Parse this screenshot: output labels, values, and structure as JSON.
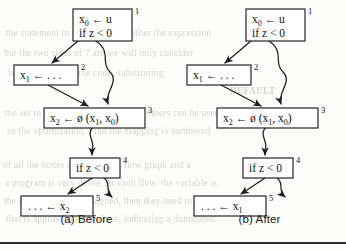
{
  "figure": {
    "panels": [
      {
        "id": "before",
        "caption": "(a) Before",
        "nodes": [
          {
            "id": "n1",
            "label": "1",
            "lines": [
              "x0 ← u",
              "if z < 0"
            ]
          },
          {
            "id": "n2",
            "label": "2",
            "lines": [
              "x1 ← . . ."
            ]
          },
          {
            "id": "n3",
            "label": "3",
            "lines": [
              "x2 ← ø (x1, x0)"
            ]
          },
          {
            "id": "n4",
            "label": "4",
            "lines": [
              "if z < 0"
            ]
          },
          {
            "id": "n5",
            "label": "5",
            "lines": [
              ". . . ← x2"
            ]
          }
        ],
        "edges": [
          {
            "from": "n1",
            "to": "n2",
            "style": "straight"
          },
          {
            "from": "n1",
            "to": "n3",
            "style": "wavy"
          },
          {
            "from": "n2",
            "to": "n3",
            "style": "straight"
          },
          {
            "from": "n3",
            "to": "n4",
            "style": "wavy"
          },
          {
            "from": "n4",
            "to": "n5",
            "style": "straight"
          },
          {
            "from": "n4",
            "to": "exit",
            "style": "wavy"
          }
        ]
      },
      {
        "id": "after",
        "caption": "(b) After",
        "nodes": [
          {
            "id": "n1",
            "label": "1",
            "lines": [
              "x0 ← u",
              "if z < 0"
            ]
          },
          {
            "id": "n2",
            "label": "2",
            "lines": [
              "x1 ← . . ."
            ]
          },
          {
            "id": "n3",
            "label": "3",
            "lines": [
              "x2 ← ø (x1, x0)"
            ]
          },
          {
            "id": "n4",
            "label": "4",
            "lines": [
              "if z < 0"
            ]
          },
          {
            "id": "n5",
            "label": "5",
            "lines": [
              ". . . ← x1"
            ]
          }
        ],
        "edges": [
          {
            "from": "n1",
            "to": "n2",
            "style": "straight"
          },
          {
            "from": "n1",
            "to": "n3",
            "style": "wavy"
          },
          {
            "from": "n2",
            "to": "n3",
            "style": "straight"
          },
          {
            "from": "n3",
            "to": "n4",
            "style": "wavy"
          },
          {
            "from": "n4",
            "to": "n5",
            "style": "straight"
          },
          {
            "from": "n4",
            "to": "exit",
            "style": "wavy"
          }
        ]
      }
    ]
  },
  "text": {
    "node_a_1_l1_base": "x",
    "node_a_1_l1_sub": "0",
    "node_a_1_l1_rest": " ← u",
    "node_a_1_l2": "if z < 0",
    "node_a_1_tag": "1",
    "node_a_2_base": "x",
    "node_a_2_sub": "1",
    "node_a_2_rest": " ← . . .",
    "node_a_2_tag": "2",
    "node_a_3_base": "x",
    "node_a_3_sub": "2",
    "node_a_3_mid": " ← ø (x",
    "node_a_3_sub2": "1",
    "node_a_3_mid2": ", x",
    "node_a_3_sub3": "0",
    "node_a_3_end": ")",
    "node_a_3_tag": "3",
    "node_a_4": "if z < 0",
    "node_a_4_tag": "4",
    "node_a_5_pre": ". . . ← x",
    "node_a_5_sub": "2",
    "node_a_5_tag": "5",
    "node_b_1_l1_base": "x",
    "node_b_1_l1_sub": "0",
    "node_b_1_l1_rest": " ← u",
    "node_b_1_l2": "if z < 0",
    "node_b_1_tag": "1",
    "node_b_2_base": "x",
    "node_b_2_sub": "1",
    "node_b_2_rest": " ← . . .",
    "node_b_2_tag": "2",
    "node_b_3_base": "x",
    "node_b_3_sub": "2",
    "node_b_3_mid": " ← ø (x",
    "node_b_3_sub2": "1",
    "node_b_3_mid2": ", x",
    "node_b_3_sub3": "0",
    "node_b_3_end": ")",
    "node_b_3_tag": "3",
    "node_b_4": "if z < 0",
    "node_b_4_tag": "4",
    "node_b_5_pre": ". . . ← x",
    "node_b_5_sub": "1",
    "node_b_5_tag": "5",
    "caption_a": "(a) Before",
    "caption_b": "(b) After"
  },
  "bleed_through": {
    "lines": [
      "the statement in question or whether the expression",
      "but the two sides of 7 are we will only consider",
      "is represented by the code, substituting",
      "DEFAULT",
      "the set to variable and a number of others can be used",
      "so the optimization. Find the mapping is numbered",
      "of all the nodes of the control flow graph and a",
      "a program is very dense. At each flow, the variable is",
      "the used previously assigned, then they need to be value",
      "that is applied to each phase, indicating a dominated"
    ]
  },
  "colors": {
    "ink": "#1d1d1d",
    "paper": "#fdfdfc",
    "rule": "#2b2b2b",
    "bleed": "rgba(120,118,112,0.30)"
  }
}
